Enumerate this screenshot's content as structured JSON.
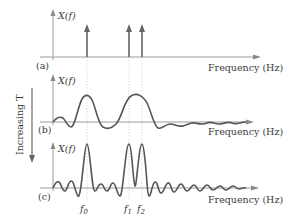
{
  "figure": {
    "y_axis_label": "X(f)",
    "x_axis_label": "Frequency (Hz)",
    "side_label": "Increasing T",
    "panels": [
      {
        "id": "a",
        "label": "(a)",
        "type": "impulses",
        "baseline_y": 57
      },
      {
        "id": "b",
        "label": "(b)",
        "type": "sinc-short",
        "baseline_y": 122
      },
      {
        "id": "c",
        "label": "(c)",
        "type": "sinc-long",
        "baseline_y": 188
      }
    ],
    "frequency_markers": [
      {
        "name": "f0",
        "label_main": "f",
        "label_sub": "0",
        "x": 87
      },
      {
        "name": "f1",
        "label_main": "f",
        "label_sub": "1",
        "x": 129
      },
      {
        "name": "f2",
        "label_main": "f",
        "label_sub": "2",
        "x": 142
      }
    ],
    "colors": {
      "axis": "#9a9a9a",
      "curve": "#555555",
      "text": "#3a3a3a",
      "guide": "#cfcfcf"
    }
  }
}
